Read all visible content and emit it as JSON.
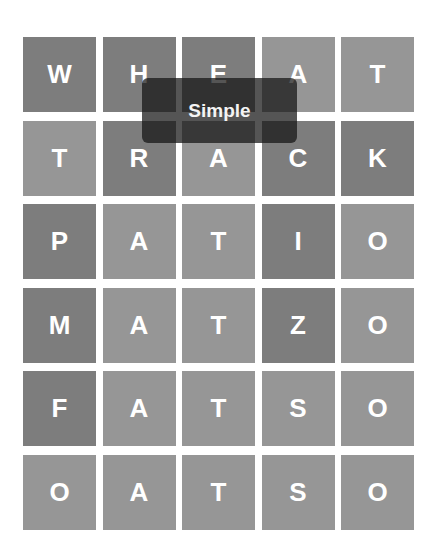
{
  "game": {
    "board": {
      "rows": [
        {
          "word": "WHEAT",
          "tiles": [
            {
              "letter": "W",
              "state": "dark"
            },
            {
              "letter": "H",
              "state": "dark"
            },
            {
              "letter": "E",
              "state": "dark"
            },
            {
              "letter": "A",
              "state": "light"
            },
            {
              "letter": "T",
              "state": "light"
            }
          ]
        },
        {
          "word": "TRACK",
          "tiles": [
            {
              "letter": "T",
              "state": "light"
            },
            {
              "letter": "R",
              "state": "dark"
            },
            {
              "letter": "A",
              "state": "light"
            },
            {
              "letter": "C",
              "state": "dark"
            },
            {
              "letter": "K",
              "state": "dark"
            }
          ]
        },
        {
          "word": "PATIO",
          "tiles": [
            {
              "letter": "P",
              "state": "dark"
            },
            {
              "letter": "A",
              "state": "light"
            },
            {
              "letter": "T",
              "state": "light"
            },
            {
              "letter": "I",
              "state": "dark"
            },
            {
              "letter": "O",
              "state": "light"
            }
          ]
        },
        {
          "word": "MATZO",
          "tiles": [
            {
              "letter": "M",
              "state": "dark"
            },
            {
              "letter": "A",
              "state": "light"
            },
            {
              "letter": "T",
              "state": "light"
            },
            {
              "letter": "Z",
              "state": "dark"
            },
            {
              "letter": "O",
              "state": "light"
            }
          ]
        },
        {
          "word": "FATSO",
          "tiles": [
            {
              "letter": "F",
              "state": "dark"
            },
            {
              "letter": "A",
              "state": "light"
            },
            {
              "letter": "T",
              "state": "light"
            },
            {
              "letter": "S",
              "state": "light"
            },
            {
              "letter": "O",
              "state": "light"
            }
          ]
        },
        {
          "word": "OATSO",
          "tiles": [
            {
              "letter": "O",
              "state": "light"
            },
            {
              "letter": "A",
              "state": "light"
            },
            {
              "letter": "T",
              "state": "light"
            },
            {
              "letter": "S",
              "state": "light"
            },
            {
              "letter": "O",
              "state": "light"
            }
          ]
        }
      ]
    },
    "toast": {
      "message": "Simple"
    },
    "colors": {
      "tile_dark": "#7d7d7d",
      "tile_light": "#969696",
      "letter": "#ffffff",
      "toast_bg": "#141414"
    }
  }
}
